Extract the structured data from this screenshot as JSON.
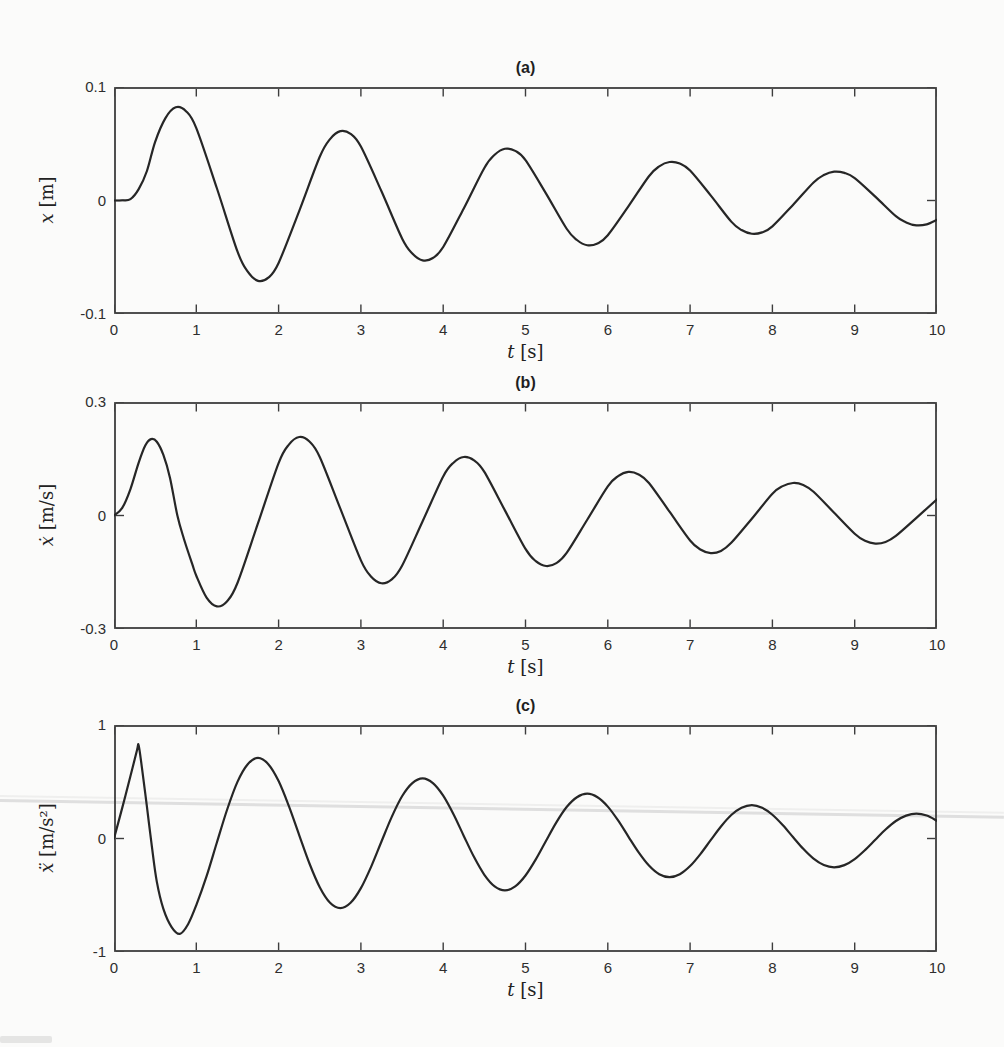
{
  "figure": {
    "frame_color": "#3d3d3d",
    "curve_color": "#262626",
    "background": "#fbfbfa"
  },
  "chart_data": [
    {
      "type": "line",
      "title": "(a)",
      "xlabel_var": "t",
      "xlabel_unit": "[s]",
      "ylabel_var": "x",
      "ylabel_unit": "[m]",
      "xlim": [
        0,
        10
      ],
      "ylim": [
        -0.1,
        0.1
      ],
      "xticks": [
        0,
        1,
        2,
        3,
        4,
        5,
        6,
        7,
        8,
        9,
        10
      ],
      "yticks": [
        0.1,
        0,
        -0.1
      ],
      "ytick_labels": [
        "0.1",
        "0",
        "-0.1"
      ],
      "grid": false,
      "legend": null,
      "series": [
        {
          "name": "x(t)",
          "points": [
            [
              0,
              0
            ],
            [
              0.1,
              0.0002
            ],
            [
              0.2,
              0.0012
            ],
            [
              0.3,
              0.01
            ],
            [
              0.4,
              0.026
            ],
            [
              0.5,
              0.0517
            ],
            [
              0.625,
              0.0726
            ],
            [
              0.75,
              0.0821
            ],
            [
              0.875,
              0.0787
            ],
            [
              1,
              0.0638
            ],
            [
              1.25,
              0.0108
            ],
            [
              1.5,
              -0.0449
            ],
            [
              1.625,
              -0.0627
            ],
            [
              1.75,
              -0.0708
            ],
            [
              1.875,
              -0.068
            ],
            [
              2,
              -0.055
            ],
            [
              2.25,
              -0.0093
            ],
            [
              2.5,
              0.0385
            ],
            [
              2.625,
              0.0541
            ],
            [
              2.75,
              0.0611
            ],
            [
              2.875,
              0.0587
            ],
            [
              3,
              0.0475
            ],
            [
              3.25,
              0.0081
            ],
            [
              3.5,
              -0.0334
            ],
            [
              3.625,
              -0.0467
            ],
            [
              3.75,
              -0.0528
            ],
            [
              3.875,
              -0.0507
            ],
            [
              4,
              -0.041
            ],
            [
              4.25,
              -0.007
            ],
            [
              4.5,
              0.0287
            ],
            [
              4.625,
              0.0403
            ],
            [
              4.75,
              0.0456
            ],
            [
              4.875,
              0.0437
            ],
            [
              5,
              0.0355
            ],
            [
              5.25,
              0.006
            ],
            [
              5.5,
              -0.0249
            ],
            [
              5.625,
              -0.0348
            ],
            [
              5.75,
              -0.0394
            ],
            [
              5.875,
              -0.0378
            ],
            [
              6,
              -0.0306
            ],
            [
              6.25,
              -0.0052
            ],
            [
              6.5,
              0.0214
            ],
            [
              6.625,
              0.0301
            ],
            [
              6.75,
              0.0339
            ],
            [
              6.875,
              0.0326
            ],
            [
              7,
              0.0264
            ],
            [
              7.25,
              0.0045
            ],
            [
              7.5,
              -0.0186
            ],
            [
              7.625,
              -0.026
            ],
            [
              7.75,
              -0.0293
            ],
            [
              7.875,
              -0.0281
            ],
            [
              8,
              -0.0228
            ],
            [
              8.25,
              -0.0039
            ],
            [
              8.5,
              0.0159
            ],
            [
              8.625,
              0.0224
            ],
            [
              8.75,
              0.0254
            ],
            [
              8.875,
              0.0243
            ],
            [
              9,
              0.0197
            ],
            [
              9.25,
              0.0034
            ],
            [
              9.5,
              -0.0138
            ],
            [
              9.625,
              -0.0193
            ],
            [
              9.75,
              -0.0219
            ],
            [
              9.875,
              -0.021
            ],
            [
              10,
              -0.017
            ]
          ]
        }
      ]
    },
    {
      "type": "line",
      "title": "(b)",
      "xlabel_var": "t",
      "xlabel_unit": "[s]",
      "ylabel_var": "ẋ",
      "ylabel_unit": "[m/s]",
      "xlim": [
        0,
        10
      ],
      "ylim": [
        -0.3,
        0.3
      ],
      "xticks": [
        0,
        1,
        2,
        3,
        4,
        5,
        6,
        7,
        8,
        9,
        10
      ],
      "yticks": [
        0.3,
        0,
        -0.3
      ],
      "ytick_labels": [
        "0.3",
        "0",
        "-0.3"
      ],
      "grid": false,
      "legend": null,
      "series": [
        {
          "name": "x-dot(t)",
          "points": [
            [
              0,
              0
            ],
            [
              0.1,
              0.02
            ],
            [
              0.2,
              0.07
            ],
            [
              0.3,
              0.14
            ],
            [
              0.38,
              0.185
            ],
            [
              0.45,
              0.202
            ],
            [
              0.52,
              0.195
            ],
            [
              0.6,
              0.16
            ],
            [
              0.68,
              0.1
            ],
            [
              0.77,
              0
            ],
            [
              0.85,
              -0.062
            ],
            [
              0.95,
              -0.128
            ],
            [
              1,
              -0.1592
            ],
            [
              1.125,
              -0.217
            ],
            [
              1.25,
              -0.2403
            ],
            [
              1.375,
              -0.2265
            ],
            [
              1.5,
              -0.1784
            ],
            [
              1.75,
              -0.0204
            ],
            [
              2,
              0.1387
            ],
            [
              2.125,
              0.1874
            ],
            [
              2.25,
              0.2074
            ],
            [
              2.375,
              0.1955
            ],
            [
              2.5,
              0.1547
            ],
            [
              2.75,
              0.0181
            ],
            [
              3,
              -0.1186
            ],
            [
              3.125,
              -0.1618
            ],
            [
              3.25,
              -0.1791
            ],
            [
              3.375,
              -0.1688
            ],
            [
              3.5,
              -0.1329
            ],
            [
              3.75,
              -0.0152
            ],
            [
              4,
              0.1033
            ],
            [
              4.125,
              0.1396
            ],
            [
              4.25,
              0.1546
            ],
            [
              4.375,
              0.1457
            ],
            [
              4.5,
              0.1153
            ],
            [
              4.75,
              0.0135
            ],
            [
              5,
              -0.0884
            ],
            [
              5.125,
              -0.1206
            ],
            [
              5.25,
              -0.1335
            ],
            [
              5.375,
              -0.1258
            ],
            [
              5.5,
              -0.099
            ],
            [
              5.75,
              -0.0113
            ],
            [
              6,
              0.077
            ],
            [
              6.125,
              0.1041
            ],
            [
              6.25,
              0.1152
            ],
            [
              6.375,
              0.1086
            ],
            [
              6.5,
              0.0859
            ],
            [
              6.75,
              0.01
            ],
            [
              7,
              -0.066
            ],
            [
              7.125,
              -0.0898
            ],
            [
              7.25,
              -0.0994
            ],
            [
              7.375,
              -0.0937
            ],
            [
              7.5,
              -0.0723
            ],
            [
              7.75,
              -0.0085
            ],
            [
              8,
              0.0574
            ],
            [
              8.125,
              0.0776
            ],
            [
              8.25,
              0.0859
            ],
            [
              8.375,
              0.0809
            ],
            [
              8.5,
              0.0627
            ],
            [
              8.75,
              0.0073
            ],
            [
              9,
              -0.0481
            ],
            [
              9.125,
              -0.067
            ],
            [
              9.25,
              -0.0741
            ],
            [
              9.375,
              -0.0699
            ],
            [
              9.5,
              -0.0539
            ],
            [
              9.75,
              -0.0062
            ],
            [
              10,
              0.0428
            ]
          ]
        }
      ]
    },
    {
      "type": "line",
      "title": "(c)",
      "xlabel_var": "t",
      "xlabel_unit": "[s]",
      "ylabel_var": "ẍ",
      "ylabel_unit": "[m/s²]",
      "xlim": [
        0,
        10
      ],
      "ylim": [
        -1,
        1
      ],
      "xticks": [
        0,
        1,
        2,
        3,
        4,
        5,
        6,
        7,
        8,
        9,
        10
      ],
      "yticks": [
        1,
        0,
        -1
      ],
      "ytick_labels": [
        "1",
        "0",
        "-1"
      ],
      "grid": false,
      "legend": null,
      "series": [
        {
          "name": "x-ddot(t)",
          "points": [
            [
              0,
              0
            ],
            [
              0.1,
              0.27
            ],
            [
              0.2,
              0.55
            ],
            [
              0.28,
              0.78
            ],
            [
              0.3,
              0.82
            ],
            [
              0.34,
              0.62
            ],
            [
              0.4,
              0.28
            ],
            [
              0.46,
              -0.07
            ],
            [
              0.52,
              -0.38
            ],
            [
              0.6,
              -0.62
            ],
            [
              0.7,
              -0.78
            ],
            [
              0.8,
              -0.84
            ],
            [
              0.9,
              -0.755
            ],
            [
              1,
              -0.5871
            ],
            [
              1.125,
              -0.332
            ],
            [
              1.25,
              -0.0356
            ],
            [
              1.375,
              0.2556
            ],
            [
              1.5,
              0.4988
            ],
            [
              1.625,
              0.6543
            ],
            [
              1.75,
              0.7105
            ],
            [
              1.875,
              0.6544
            ],
            [
              2,
              0.5059
            ],
            [
              2.125,
              0.2849
            ],
            [
              2.25,
              0.0307
            ],
            [
              2.375,
              -0.2201
            ],
            [
              2.5,
              -0.4289
            ],
            [
              2.625,
              -0.5659
            ],
            [
              2.75,
              -0.6134
            ],
            [
              2.875,
              -0.5665
            ],
            [
              3,
              -0.4375
            ],
            [
              3.125,
              -0.2474
            ],
            [
              3.25,
              -0.0266
            ],
            [
              3.375,
              0.1905
            ],
            [
              3.5,
              0.3718
            ],
            [
              3.625,
              0.4876
            ],
            [
              3.75,
              0.5296
            ],
            [
              3.875,
              0.4877
            ],
            [
              4,
              0.377
            ],
            [
              4.125,
              0.2135
            ],
            [
              4.25,
              0.0229
            ],
            [
              4.375,
              -0.164
            ],
            [
              4.5,
              -0.3197
            ],
            [
              4.625,
              -0.4218
            ],
            [
              4.75,
              -0.4571
            ],
            [
              4.875,
              -0.4222
            ],
            [
              5,
              -0.3261
            ],
            [
              5.125,
              -0.1844
            ],
            [
              5.25,
              -0.0198
            ],
            [
              5.375,
              0.142
            ],
            [
              5.5,
              0.277
            ],
            [
              5.625,
              0.3634
            ],
            [
              5.75,
              0.3947
            ],
            [
              5.875,
              0.3634
            ],
            [
              6,
              0.281
            ],
            [
              6.125,
              0.1591
            ],
            [
              6.25,
              0.0171
            ],
            [
              6.375,
              -0.1222
            ],
            [
              6.5,
              -0.2382
            ],
            [
              6.625,
              -0.3144
            ],
            [
              6.75,
              -0.3407
            ],
            [
              6.875,
              -0.3147
            ],
            [
              7,
              -0.243
            ],
            [
              7.125,
              -0.1374
            ],
            [
              7.25,
              -0.0147
            ],
            [
              7.375,
              0.1058
            ],
            [
              7.5,
              0.2065
            ],
            [
              7.625,
              0.2708
            ],
            [
              7.75,
              0.294
            ],
            [
              7.875,
              0.2709
            ],
            [
              8,
              0.2094
            ],
            [
              8.125,
              0.1186
            ],
            [
              8.25,
              0.0127
            ],
            [
              8.375,
              -0.0911
            ],
            [
              8.5,
              -0.1776
            ],
            [
              8.625,
              -0.2343
            ],
            [
              8.75,
              -0.254
            ],
            [
              8.875,
              -0.2346
            ],
            [
              9,
              -0.1811
            ],
            [
              9.125,
              -0.1024
            ],
            [
              9.25,
              -0.0114
            ],
            [
              9.375,
              0.0789
            ],
            [
              9.5,
              0.1539
            ],
            [
              9.625,
              0.2018
            ],
            [
              9.75,
              0.2191
            ],
            [
              9.875,
              0.2019
            ],
            [
              10,
              0.1561
            ]
          ]
        }
      ]
    }
  ]
}
